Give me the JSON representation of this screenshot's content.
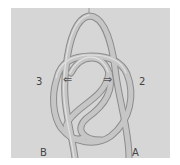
{
  "image": {
    "subject": "rope knot diagram photo",
    "background_color": "#d6d6d6",
    "rope_color": "#c4c4c4",
    "rope_shadow": "#8f8f8f"
  },
  "labels": {
    "left_number": "3",
    "right_number": "2",
    "bottom_left": "B",
    "bottom_right": "A",
    "left_arrow": "⇐",
    "right_arrow": "⇒"
  }
}
